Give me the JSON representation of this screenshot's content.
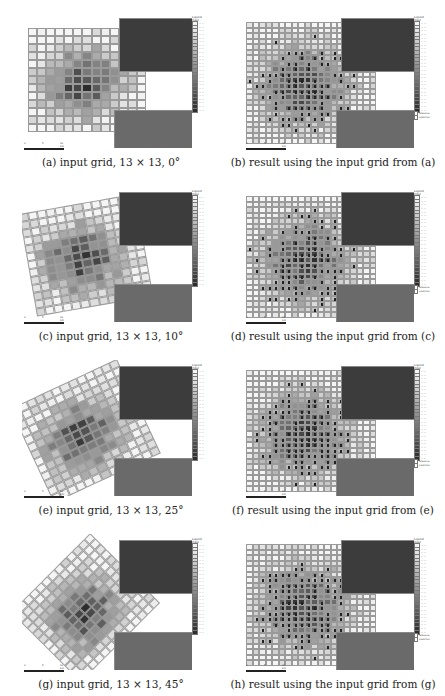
{
  "figure": {
    "panels": [
      {
        "id": "a",
        "caption": "(a) input grid, 13 × 13, 0°",
        "type": "input",
        "rotation": 0,
        "x": 0,
        "y": 0
      },
      {
        "id": "b",
        "caption": "(b) result using the input grid from (a)",
        "type": "result",
        "rotation": 0,
        "x": 222,
        "y": 0
      },
      {
        "id": "c",
        "caption": "(c) input grid, 13 × 13, 10°",
        "type": "input",
        "rotation": 10,
        "x": 0,
        "y": 174
      },
      {
        "id": "d",
        "caption": "(d) result using the input grid from (c)",
        "type": "result",
        "rotation": 0,
        "x": 222,
        "y": 174
      },
      {
        "id": "e",
        "caption": "(e) input grid, 13 × 13, 25°",
        "type": "input",
        "rotation": 25,
        "x": 0,
        "y": 348
      },
      {
        "id": "f",
        "caption": "(f) result using the input grid from (e)",
        "type": "result",
        "rotation": 0,
        "x": 222,
        "y": 348
      },
      {
        "id": "g",
        "caption": "(g) input grid, 13 × 13, 45°",
        "type": "input",
        "rotation": 45,
        "x": 0,
        "y": 522
      },
      {
        "id": "h",
        "caption": "(h) result using the input grid from (g)",
        "type": "result",
        "rotation": 0,
        "x": 222,
        "y": 522
      }
    ],
    "legend": {
      "title": "Legend",
      "subtitle": "Input",
      "num_classes": 25,
      "result_extra": [
        "reference",
        "prediction"
      ]
    },
    "scalebar": {
      "labels": [
        "0",
        "5",
        "10 km"
      ]
    }
  }
}
